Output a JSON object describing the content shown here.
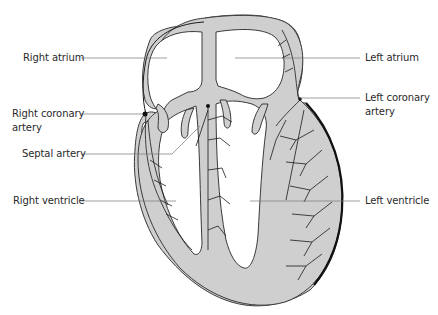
{
  "diagram": {
    "colors": {
      "muscle_fill": "#cfcfcf",
      "outline": "#3a3a3a",
      "vessel": "#1a1a1a",
      "leader_line": "#666666",
      "background": "#ffffff"
    },
    "labels": {
      "right_atrium": "Right atrium",
      "right_coronary_artery_line1": "Right coronary",
      "right_coronary_artery_line2": "artery",
      "septal_artery": "Septal artery",
      "right_ventricle": "Right ventricle",
      "left_atrium": "Left atrium",
      "left_coronary_artery_line1": "Left coronary",
      "left_coronary_artery_line2": "artery",
      "left_ventricle": "Left ventricle"
    }
  }
}
